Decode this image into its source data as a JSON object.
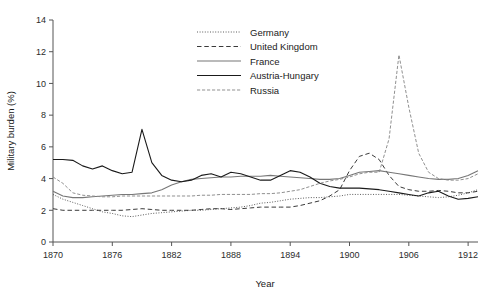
{
  "chart_data": {
    "type": "line",
    "title": "",
    "xlabel": "Year",
    "ylabel": "Military burden (%)",
    "xlim": [
      1870,
      1913
    ],
    "ylim": [
      0,
      14
    ],
    "xticks": [
      1870,
      1876,
      1882,
      1888,
      1894,
      1900,
      1906,
      1912
    ],
    "yticks": [
      0,
      2,
      4,
      6,
      8,
      10,
      12,
      14
    ],
    "grid": false,
    "legend_position": "top-center-right",
    "x": [
      1870,
      1871,
      1872,
      1873,
      1874,
      1875,
      1876,
      1877,
      1878,
      1879,
      1880,
      1881,
      1882,
      1883,
      1884,
      1885,
      1886,
      1887,
      1888,
      1889,
      1890,
      1891,
      1892,
      1893,
      1894,
      1895,
      1896,
      1897,
      1898,
      1899,
      1900,
      1901,
      1902,
      1903,
      1904,
      1905,
      1906,
      1907,
      1908,
      1909,
      1910,
      1911,
      1912,
      1913
    ],
    "series": [
      {
        "name": "Germany",
        "style": "dotted",
        "color": "#4a4a4a",
        "values": [
          3.0,
          2.7,
          2.5,
          2.3,
          2.1,
          1.9,
          1.8,
          1.65,
          1.6,
          1.7,
          1.8,
          1.85,
          1.9,
          1.95,
          2.0,
          2.0,
          2.05,
          2.1,
          2.15,
          2.2,
          2.3,
          2.45,
          2.5,
          2.6,
          2.7,
          2.75,
          2.8,
          2.8,
          2.85,
          2.9,
          3.0,
          3.0,
          3.0,
          3.0,
          3.0,
          3.0,
          2.95,
          2.9,
          2.85,
          2.8,
          2.85,
          2.95,
          3.1,
          3.3
        ]
      },
      {
        "name": "United Kingdom",
        "style": "dashed",
        "color": "#3a3a3a",
        "values": [
          2.1,
          2.0,
          2.0,
          2.0,
          2.0,
          2.0,
          2.0,
          2.0,
          2.05,
          2.1,
          2.05,
          2.0,
          2.0,
          2.0,
          2.0,
          2.05,
          2.1,
          2.1,
          2.05,
          2.1,
          2.15,
          2.2,
          2.2,
          2.2,
          2.2,
          2.3,
          2.45,
          2.6,
          2.9,
          3.3,
          4.5,
          5.4,
          5.6,
          5.2,
          4.2,
          3.5,
          3.3,
          3.2,
          3.2,
          3.25,
          3.2,
          3.1,
          3.1,
          3.2
        ]
      },
      {
        "name": "France",
        "style": "solid-thin",
        "color": "#777777",
        "values": [
          3.2,
          2.9,
          2.8,
          2.8,
          2.85,
          2.9,
          2.95,
          3.0,
          3.0,
          3.05,
          3.1,
          3.3,
          3.6,
          3.8,
          3.95,
          4.0,
          4.05,
          4.1,
          4.1,
          4.15,
          4.15,
          4.15,
          4.2,
          4.15,
          4.1,
          4.05,
          4.0,
          3.95,
          3.95,
          4.0,
          4.2,
          4.4,
          4.45,
          4.5,
          4.4,
          4.3,
          4.2,
          4.1,
          4.0,
          3.95,
          3.95,
          4.0,
          4.2,
          4.5
        ]
      },
      {
        "name": "Austria-Hungary",
        "style": "solid",
        "color": "#1a1a1a",
        "values": [
          5.2,
          5.2,
          5.15,
          4.8,
          4.6,
          4.8,
          4.5,
          4.3,
          4.4,
          7.1,
          5.0,
          4.2,
          3.9,
          3.8,
          3.9,
          4.2,
          4.3,
          4.1,
          4.4,
          4.3,
          4.1,
          3.9,
          3.9,
          4.2,
          4.5,
          4.4,
          4.1,
          3.7,
          3.5,
          3.4,
          3.4,
          3.4,
          3.35,
          3.3,
          3.2,
          3.1,
          3.0,
          2.9,
          3.1,
          3.2,
          2.9,
          2.7,
          2.75,
          2.85
        ]
      },
      {
        "name": "Russia",
        "style": "dashdot",
        "color": "#8a8a8a",
        "values": [
          4.1,
          3.7,
          3.1,
          2.95,
          2.9,
          2.85,
          2.85,
          2.9,
          2.9,
          2.9,
          2.9,
          2.9,
          2.9,
          2.9,
          2.9,
          2.95,
          2.95,
          3.0,
          3.0,
          3.0,
          3.0,
          3.05,
          3.05,
          3.1,
          3.2,
          3.3,
          3.5,
          3.7,
          3.85,
          3.95,
          4.1,
          4.3,
          4.4,
          4.4,
          6.5,
          11.8,
          8.5,
          5.6,
          4.4,
          4.0,
          3.9,
          3.9,
          4.0,
          4.3
        ]
      }
    ]
  },
  "legend": {
    "items": [
      {
        "label": "Germany"
      },
      {
        "label": "United Kingdom"
      },
      {
        "label": "France"
      },
      {
        "label": "Austria-Hungary"
      },
      {
        "label": "Russia"
      }
    ]
  },
  "axes": {
    "x_tick_labels": [
      "1870",
      "1876",
      "1882",
      "1888",
      "1894",
      "1900",
      "1906",
      "1912"
    ],
    "y_tick_labels": [
      "0",
      "2",
      "4",
      "6",
      "8",
      "10",
      "12",
      "14"
    ],
    "x_axis_title": "Year",
    "y_axis_title": "Military burden (%)"
  }
}
